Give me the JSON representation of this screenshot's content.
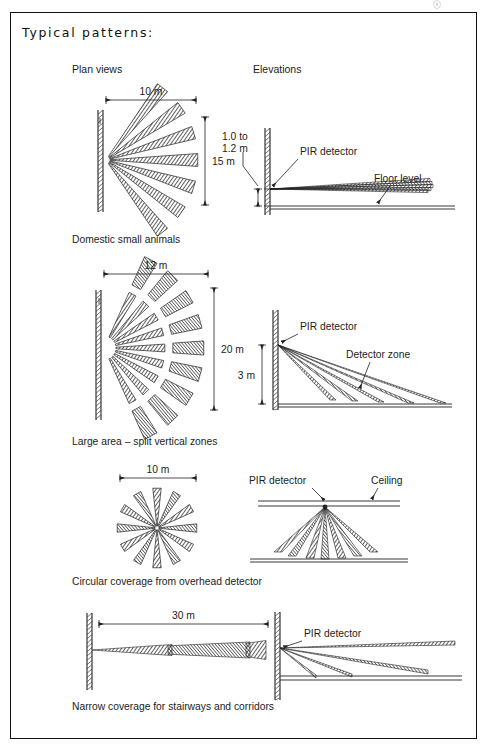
{
  "sheet": {
    "title": "Typical patterns:",
    "border_color": "#111111"
  },
  "columns": {
    "plan_label": "Plan views",
    "elevation_label": "Elevations"
  },
  "labels": {
    "pir_detector": "PIR detector",
    "floor_level": "Floor level",
    "detector_zone": "Detector zone",
    "ceiling": "Ceiling"
  },
  "rows": [
    {
      "id": "domestic-small-animals",
      "caption": "Domestic small animals",
      "plan": {
        "type": "fan",
        "width_dim": "10 m",
        "depth_dim": "15 m",
        "beam_count": 7,
        "half_angle_deg": 52,
        "split_radial": false
      },
      "elevation": {
        "type": "wall-shallow",
        "mount_height_dim": "1.0 to\n1.2 m",
        "mount_height_line1": "1.0 to",
        "mount_height_line2": "1.2 m",
        "callouts": [
          "PIR detector",
          "Floor level"
        ],
        "beam_count": 5
      }
    },
    {
      "id": "large-area-split-vertical-zones",
      "caption": "Large area – split vertical zones",
      "plan": {
        "type": "fan",
        "width_dim": "12 m",
        "depth_dim": "20 m",
        "beam_count": 9,
        "half_angle_deg": 62,
        "split_radial": true,
        "radial_bands": 2
      },
      "elevation": {
        "type": "wall-steep",
        "mount_height_dim": "3 m",
        "callouts": [
          "PIR detector",
          "Detector zone"
        ],
        "beam_count": 5
      }
    },
    {
      "id": "circular-overhead",
      "caption": "Circular coverage from overhead detector",
      "plan": {
        "type": "radial",
        "width_dim": "10 m",
        "beam_count": 12
      },
      "elevation": {
        "type": "ceiling",
        "callouts": [
          "PIR detector",
          "Ceiling"
        ],
        "beam_count": 7
      }
    },
    {
      "id": "narrow-corridor",
      "caption": "Narrow coverage for stairways and corridors",
      "plan": {
        "type": "corridor",
        "width_dim": "30 m",
        "segments": 3
      },
      "elevation": {
        "type": "wall-long",
        "callouts": [
          "PIR detector"
        ],
        "beam_count": 4
      }
    }
  ]
}
